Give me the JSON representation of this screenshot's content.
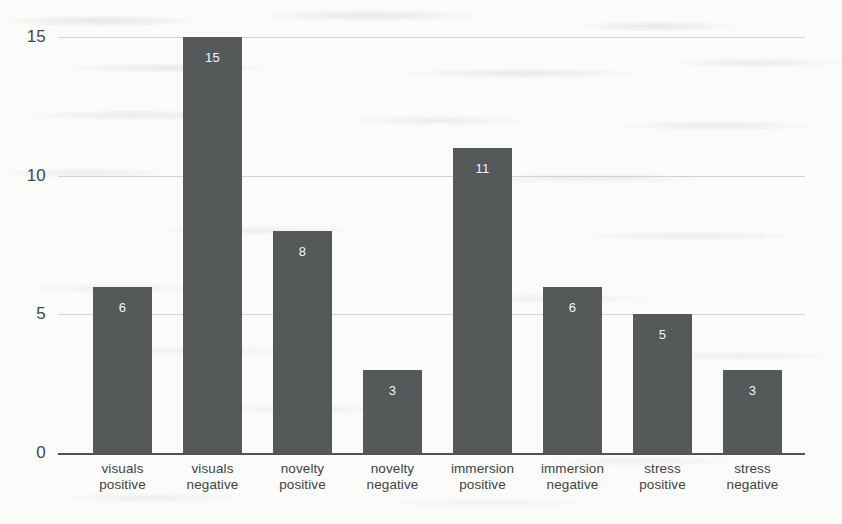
{
  "chart_data": {
    "type": "bar",
    "title": "",
    "subtitle": "",
    "xlabel": "",
    "ylabel": "",
    "categories": [
      "visuals positive",
      "visuals negative",
      "novelty positive",
      "novelty negative",
      "immersion positive",
      "immersion negative",
      "stress positive",
      "stress negative"
    ],
    "category_lines": [
      [
        "visuals",
        "positive"
      ],
      [
        "visuals",
        "negative"
      ],
      [
        "novelty",
        "positive"
      ],
      [
        "novelty",
        "negative"
      ],
      [
        "immersion",
        "positive"
      ],
      [
        "immersion",
        "negative"
      ],
      [
        "stress",
        "positive"
      ],
      [
        "stress",
        "negative"
      ]
    ],
    "values": [
      6,
      15,
      8,
      3,
      11,
      6,
      5,
      3
    ],
    "value_labels": [
      "6",
      "15",
      "8",
      "3",
      "11",
      "6",
      "5",
      "3"
    ],
    "ylim": [
      0,
      15
    ],
    "yticks": [
      0,
      5,
      10,
      15
    ],
    "ytick_labels": [
      "0",
      "5",
      "10",
      "15"
    ],
    "grid": true,
    "grid_axis": "y",
    "legend": false,
    "legend_position": "none",
    "bar_color": "#55595a",
    "value_label_color": "#f4f4f4",
    "gridline_color": "#c9cccb",
    "axis_color": "#4f5453",
    "tick_label_color": "#45494a",
    "category_label_color": "#3f4344",
    "background_color": "#fbfbfa"
  },
  "geometry": {
    "plot_left": 93,
    "plot_right": 805,
    "baseline_y": 453,
    "top_y": 37,
    "bar_width": 59,
    "bar_pitch": 90,
    "ytick_y": {
      "0": 453,
      "5": 314,
      "10": 175,
      "15": 37
    }
  }
}
